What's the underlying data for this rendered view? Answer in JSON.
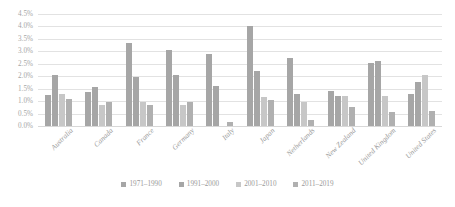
{
  "chart_data": {
    "type": "bar",
    "title": "",
    "subtitle": "",
    "xlabel": "",
    "ylabel": "",
    "ylim": [
      0,
      4.5
    ],
    "y_tick_step": 0.5,
    "y_tick_labels": [
      "4.5%",
      "4.0%",
      "3.5%",
      "3.0%",
      "2.5%",
      "2.0%",
      "1.5%",
      "1.0%",
      "0.5%",
      "0.0%"
    ],
    "grid": true,
    "legend_position": "bottom",
    "value_unit": "%",
    "categories": [
      "Australia",
      "Canada",
      "France",
      "Germany",
      "Italy",
      "Japan",
      "Netherlands",
      "New Zealand",
      "United Kingdom",
      "United States"
    ],
    "series": [
      {
        "name": "1971–1990",
        "color": "#a6a6a6",
        "values": [
          1.25,
          1.35,
          3.35,
          3.05,
          2.9,
          4.0,
          2.75,
          1.4,
          2.55,
          1.3
        ]
      },
      {
        "name": "1991–2000",
        "color": "#a6a6a6",
        "values": [
          2.05,
          1.55,
          1.95,
          2.05,
          1.6,
          2.2,
          1.3,
          1.2,
          2.6,
          1.75
        ]
      },
      {
        "name": "2001–2010",
        "color": "#c7c7c7",
        "values": [
          1.3,
          0.85,
          0.95,
          0.85,
          0.0,
          1.15,
          0.95,
          1.2,
          1.2,
          2.05
        ]
      },
      {
        "name": "2011–2019",
        "color": "#b0b0b0",
        "values": [
          1.1,
          0.95,
          0.85,
          0.95,
          0.15,
          1.05,
          0.25,
          0.75,
          0.55,
          0.6
        ]
      }
    ]
  },
  "legend": {
    "items": [
      {
        "label": "1971–1990",
        "color": "#a6a6a6"
      },
      {
        "label": "1991–2000",
        "color": "#a6a6a6"
      },
      {
        "label": "2001–2010",
        "color": "#c7c7c7"
      },
      {
        "label": "2011–2019",
        "color": "#b0b0b0"
      }
    ]
  }
}
